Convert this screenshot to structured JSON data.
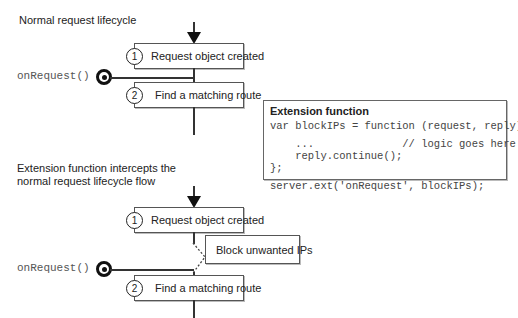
{
  "top": {
    "caption": "Normal request lifecycle",
    "steps": [
      {
        "num": "1",
        "label": "Request object created"
      },
      {
        "num": "2",
        "label": "Find a matching route"
      }
    ],
    "hook_label": "onRequest()"
  },
  "extension": {
    "title": "Extension function",
    "code_lines": [
      "var blockIPs = function (request, reply) {",
      "",
      "    ...              // logic goes here",
      "    reply.continue();",
      "};",
      "",
      "server.ext('onRequest', blockIPs);"
    ]
  },
  "bottom": {
    "caption_line1": "Extension function intercepts the",
    "caption_line2": "normal request lifecycle flow",
    "steps": [
      {
        "num": "1",
        "label": "Request object created"
      },
      {
        "num": "2",
        "label": "Find a matching route"
      }
    ],
    "intercept_label": "Block unwanted IPs",
    "hook_label": "onRequest()"
  },
  "icons": {
    "flow_arrow": "down-arrow-icon",
    "hook_marker": "bullseye-icon"
  }
}
